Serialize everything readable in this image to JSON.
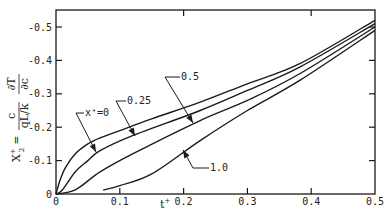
{
  "chart_data": {
    "type": "line",
    "title": "",
    "xlabel": "t+",
    "ylabel": "X2+ = c/(qL/k) · ∂T/∂c",
    "xlim": [
      0,
      0.5
    ],
    "ylim": [
      0,
      -0.55
    ],
    "x_ticks": [
      "0",
      "0.1",
      "0.2",
      "0.3",
      "0.4",
      "0.5"
    ],
    "y_ticks": [
      "0",
      "-0.1",
      "-0.2",
      "-0.3",
      "-0.4",
      "-0.5"
    ],
    "grid": false,
    "legend": "inline arrow labels",
    "series": [
      {
        "name": "x+=0",
        "label": "x⁺=0",
        "points": [
          [
            0,
            0
          ],
          [
            0.006,
            -0.04
          ],
          [
            0.015,
            -0.08
          ],
          [
            0.03,
            -0.12
          ],
          [
            0.05,
            -0.15
          ],
          [
            0.069,
            -0.168
          ],
          [
            0.1,
            -0.19
          ],
          [
            0.15,
            -0.225
          ],
          [
            0.226,
            -0.275
          ],
          [
            0.3,
            -0.33
          ],
          [
            0.382,
            -0.39
          ],
          [
            0.5,
            -0.52
          ]
        ]
      },
      {
        "name": "x+=0.25",
        "label": "0.25",
        "points": [
          [
            0,
            0
          ],
          [
            0.01,
            -0.012
          ],
          [
            0.03,
            -0.066
          ],
          [
            0.05,
            -0.1
          ],
          [
            0.069,
            -0.13
          ],
          [
            0.12,
            -0.175
          ],
          [
            0.226,
            -0.25
          ],
          [
            0.3,
            -0.31
          ],
          [
            0.382,
            -0.38
          ],
          [
            0.5,
            -0.51
          ]
        ]
      },
      {
        "name": "x+=0.5",
        "label": "0.5",
        "points": [
          [
            0,
            0
          ],
          [
            0.03,
            -0.012
          ],
          [
            0.069,
            -0.066
          ],
          [
            0.12,
            -0.12
          ],
          [
            0.226,
            -0.22
          ],
          [
            0.3,
            -0.28
          ],
          [
            0.382,
            -0.36
          ],
          [
            0.5,
            -0.5
          ]
        ]
      },
      {
        "name": "x+=1.0",
        "label": "1.0",
        "points": [
          [
            0.074,
            -0.012
          ],
          [
            0.1,
            -0.025
          ],
          [
            0.15,
            -0.06
          ],
          [
            0.226,
            -0.16
          ],
          [
            0.3,
            -0.25
          ],
          [
            0.382,
            -0.34
          ],
          [
            0.5,
            -0.49
          ]
        ]
      }
    ],
    "annotations": [
      {
        "text": "x⁺=0",
        "target_series": "x+=0"
      },
      {
        "text": "0.25",
        "target_series": "x+=0.25"
      },
      {
        "text": "0.5",
        "target_series": "x+=0.5"
      },
      {
        "text": "1.0",
        "target_series": "x+=1.0"
      }
    ]
  },
  "labels": {
    "xlabel_main": "t",
    "xlabel_sup": "+",
    "ylabel_lhs": "X",
    "ylabel_sub": "2",
    "ylabel_sup": "+",
    "ylabel_eq": "=",
    "ylabel_frac1_num": "c",
    "ylabel_frac1_den": "qL/k",
    "ylabel_frac2_num": "∂T",
    "ylabel_frac2_den": "∂c"
  },
  "style": {
    "line_color": "#1a1a1a",
    "background": "#ffffff"
  }
}
